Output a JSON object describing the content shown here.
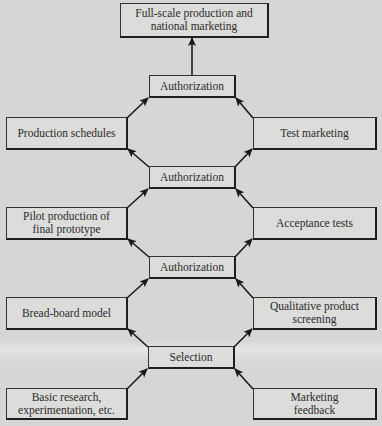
{
  "diagram": {
    "type": "flowchart",
    "direction": "bottom-to-top",
    "nodes": [
      {
        "id": "top",
        "label": "Full-scale production and\nnational marketing"
      },
      {
        "id": "auth1",
        "label": "Authorization"
      },
      {
        "id": "prod_sched",
        "label": "Production schedules"
      },
      {
        "id": "test_mkt",
        "label": "Test marketing"
      },
      {
        "id": "auth2",
        "label": "Authorization"
      },
      {
        "id": "pilot",
        "label": "Pilot production of\nfinal prototype"
      },
      {
        "id": "accept",
        "label": "Acceptance tests"
      },
      {
        "id": "auth3",
        "label": "Authorization"
      },
      {
        "id": "breadboard",
        "label": "Bread-board model"
      },
      {
        "id": "qual",
        "label": "Qualitative product\nscreening"
      },
      {
        "id": "selection",
        "label": "Selection"
      },
      {
        "id": "basic",
        "label": "Basic research,\nexperimentation, etc."
      },
      {
        "id": "mkt_fb",
        "label": "Marketing\nfeedback"
      }
    ],
    "edges": [
      {
        "from": "basic",
        "to": "selection"
      },
      {
        "from": "mkt_fb",
        "to": "selection"
      },
      {
        "from": "selection",
        "to": "breadboard"
      },
      {
        "from": "selection",
        "to": "qual"
      },
      {
        "from": "breadboard",
        "to": "auth3"
      },
      {
        "from": "qual",
        "to": "auth3"
      },
      {
        "from": "auth3",
        "to": "pilot"
      },
      {
        "from": "auth3",
        "to": "accept"
      },
      {
        "from": "pilot",
        "to": "auth2"
      },
      {
        "from": "accept",
        "to": "auth2"
      },
      {
        "from": "auth2",
        "to": "prod_sched"
      },
      {
        "from": "auth2",
        "to": "test_mkt"
      },
      {
        "from": "prod_sched",
        "to": "auth1"
      },
      {
        "from": "test_mkt",
        "to": "auth1"
      },
      {
        "from": "auth1",
        "to": "top"
      }
    ]
  }
}
